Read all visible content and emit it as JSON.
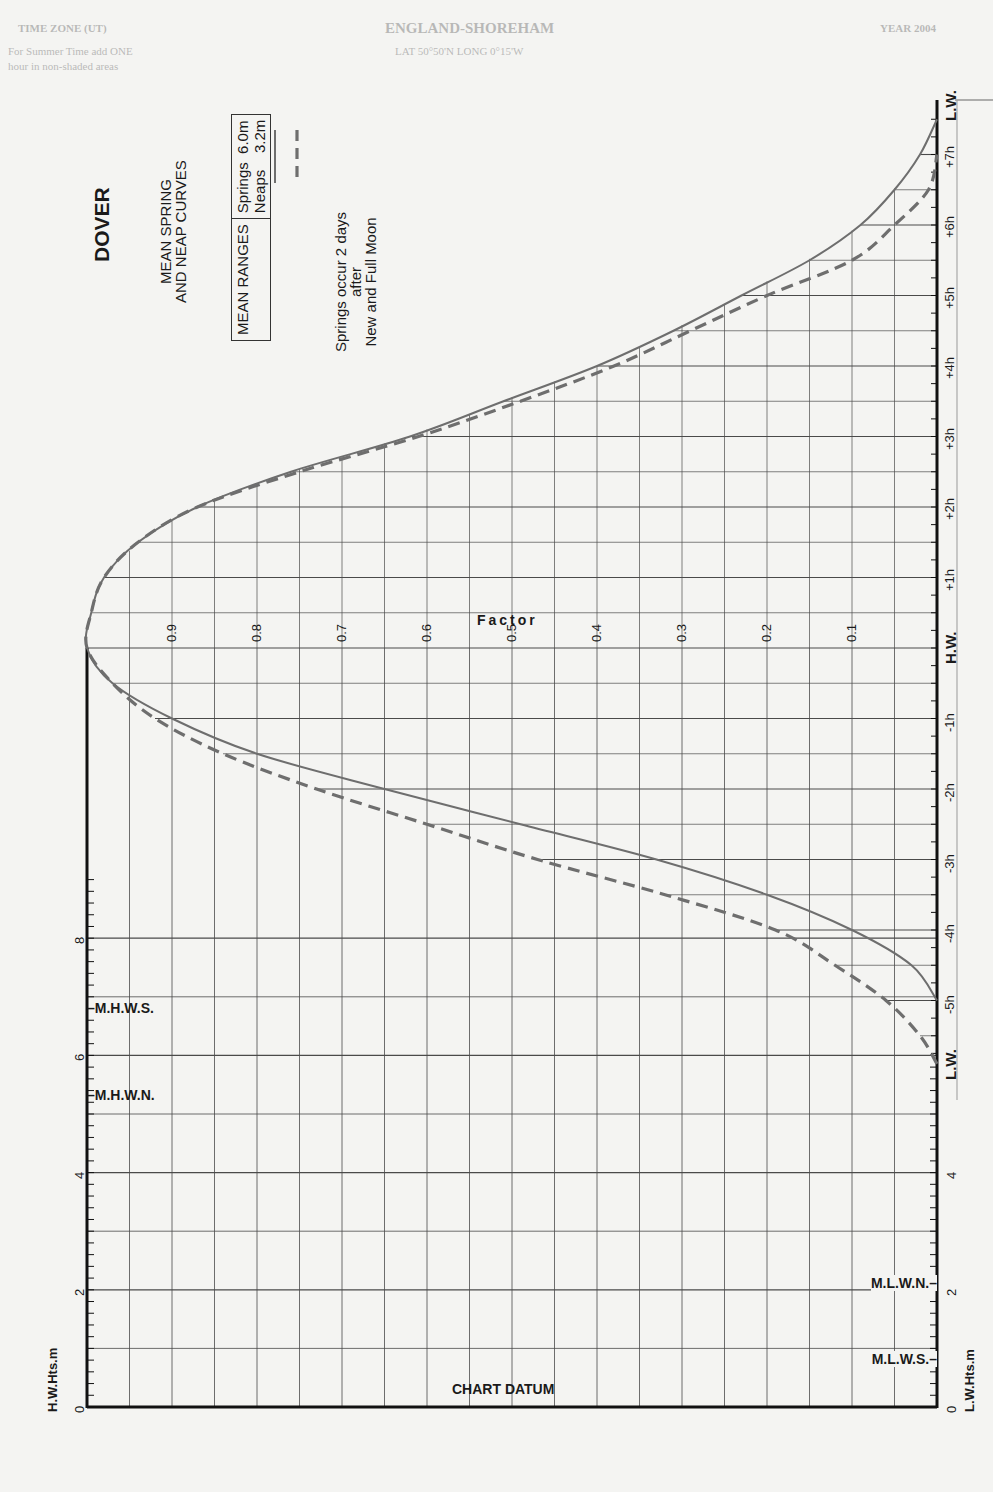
{
  "page_header_bleed": {
    "left": "TIME ZONE (UT)",
    "center": "ENGLAND-SHOREHAM",
    "right": "YEAR 2004",
    "line2_left": "For Summer Time add ONE",
    "line2_center": "LAT 50°50'N   LONG 0°15'W",
    "line3_left": "hour in non-shaded areas"
  },
  "title": "DOVER",
  "subtitle_line1": "MEAN SPRING",
  "subtitle_line2": "AND NEAP CURVES",
  "ranges_box": {
    "header": "MEAN RANGES",
    "springs_label": "Springs  6.0m",
    "neaps_label": "Neaps    3.2m"
  },
  "note_line1": "Springs occur 2 days",
  "note_line2": "after",
  "note_line3": "New and Full Moon",
  "factor_label": "Factor",
  "chart_datum_label": "CHART DATUM",
  "hw_axis_label": "H.W.Hts.m",
  "lw_axis_label": "L.W.Hts.m",
  "hw_marks": [
    {
      "label": "M.H.W.S.",
      "value": 6.8
    },
    {
      "label": "M.H.W.N.",
      "value": 5.3
    }
  ],
  "lw_marks": [
    {
      "label": "M.L.W.N.",
      "value": 2.1
    },
    {
      "label": "M.L.W.S.",
      "value": 0.8
    }
  ],
  "colors": {
    "grid": "#4a4a4a",
    "axis": "#111111",
    "springs": "#6e6e6e",
    "neaps": "#6e6e6e",
    "paper": "#f4f4f2"
  },
  "chart_data": {
    "type": "line",
    "xlabel": "Factor",
    "ylabel": "Time relative to High Water (hours)",
    "x_ticks": [
      "0.9",
      "0.8",
      "0.7",
      "0.6",
      "0.5",
      "0.4",
      "0.3",
      "0.2",
      "0.1"
    ],
    "x_range": [
      1.0,
      0.0
    ],
    "time_ticks": [
      "L.W.",
      "+7h",
      "+6h",
      "+5h",
      "+4h",
      "+3h",
      "+2h",
      "+1h",
      "H.W.",
      "-1h",
      "-2h",
      "-3h",
      "-4h",
      "-5h",
      "L.W."
    ],
    "time_range_hours": [
      -6,
      7.7
    ],
    "hw_height_axis": {
      "label": "H.W.Hts.m",
      "ticks": [
        "0",
        "2",
        "4",
        "6",
        "8"
      ],
      "range": [
        0,
        8
      ]
    },
    "lw_height_axis": {
      "label": "L.W.Hts.m",
      "ticks": [
        "0",
        "2",
        "4"
      ],
      "range": [
        0,
        4
      ]
    },
    "legend": [
      {
        "name": "Springs",
        "range_m": 6.0,
        "style": "solid"
      },
      {
        "name": "Neaps",
        "range_m": 3.2,
        "style": "dashed"
      }
    ],
    "series": [
      {
        "name": "Springs",
        "style": "solid",
        "time_h": [
          -5.0,
          -4.5,
          -4.0,
          -3.5,
          -3.0,
          -2.5,
          -2.0,
          -1.5,
          -1.0,
          -0.5,
          0.0,
          0.5,
          1.0,
          1.5,
          2.0,
          2.5,
          3.0,
          3.5,
          4.0,
          4.5,
          5.0,
          5.5,
          6.0,
          6.5,
          7.0,
          7.5
        ],
        "factor": [
          0.0,
          0.03,
          0.1,
          0.2,
          0.33,
          0.49,
          0.65,
          0.8,
          0.9,
          0.97,
          1.0,
          0.995,
          0.98,
          0.94,
          0.87,
          0.76,
          0.62,
          0.51,
          0.4,
          0.31,
          0.23,
          0.15,
          0.09,
          0.05,
          0.02,
          0.0
        ]
      },
      {
        "name": "Neaps",
        "style": "dashed",
        "time_h": [
          -5.9,
          -5.5,
          -5.0,
          -4.5,
          -4.0,
          -3.5,
          -3.0,
          -2.5,
          -2.0,
          -1.5,
          -1.0,
          -0.5,
          0.0,
          0.5,
          1.0,
          1.5,
          2.0,
          2.5,
          3.0,
          3.5,
          4.0,
          4.5,
          5.0,
          5.5,
          6.0,
          6.5,
          7.0
        ],
        "factor": [
          0.0,
          0.02,
          0.06,
          0.12,
          0.19,
          0.32,
          0.47,
          0.6,
          0.73,
          0.84,
          0.92,
          0.97,
          1.0,
          0.995,
          0.98,
          0.94,
          0.87,
          0.75,
          0.61,
          0.49,
          0.38,
          0.29,
          0.2,
          0.1,
          0.05,
          0.01,
          0.0
        ]
      }
    ],
    "grid": true
  }
}
